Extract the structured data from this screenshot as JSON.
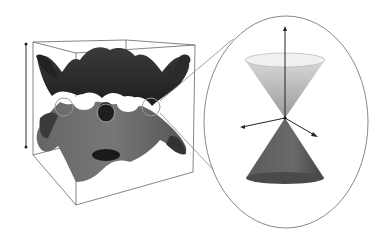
{
  "figure": {
    "labels": []
  },
  "colors": {
    "background": "#ffffff",
    "box_line": "#555555",
    "surface_dark": "#2a2a2a",
    "surface_mid": "#5a5a5a",
    "surface_light": "#8a8a8a",
    "cone_upper_top": "#e8e8e8",
    "cone_upper_bottom": "#9a9a9a",
    "cone_lower": "#555555",
    "inset_ellipse": "#888888"
  },
  "inset": {
    "shape": "ellipse",
    "content": "dirac-cone",
    "axes": [
      "energy-axis-up",
      "momentum-axis-left",
      "momentum-axis-right"
    ]
  },
  "dirac_points_circled": 3
}
